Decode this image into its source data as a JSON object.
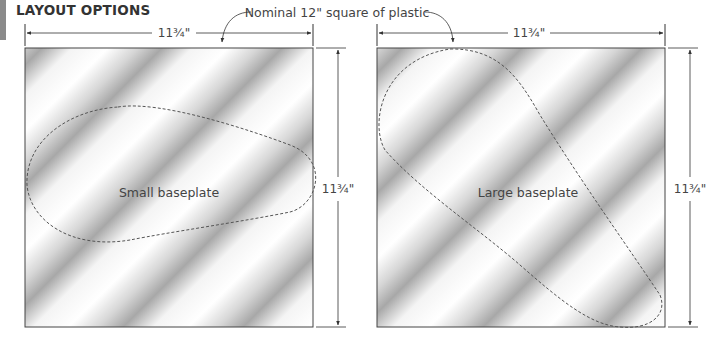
{
  "title": "LAYOUT OPTIONS",
  "callout": "Nominal 12\" square of plastic",
  "panels": [
    {
      "id": "small",
      "label": "Small baseplate",
      "width_dim": "11¾\"",
      "height_dim": "11¾\""
    },
    {
      "id": "large",
      "label": "Large baseplate",
      "width_dim": "11¾\"",
      "height_dim": "11¾\""
    }
  ],
  "colors": {
    "line": "#333333",
    "dashed_outline": "#555555",
    "plastic_light": "#ffffff",
    "plastic_dark": "#a9a9a9"
  }
}
